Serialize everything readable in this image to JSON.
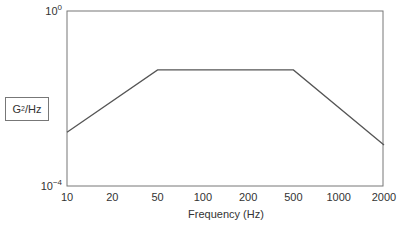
{
  "chart_data": {
    "type": "line",
    "title": "",
    "xlabel": "Frequency (Hz)",
    "ylabel": "G²/Hz",
    "ylabel_base": "G",
    "ylabel_sup": "2",
    "ylabel_rest": "/Hz",
    "x_ticks": [
      "10",
      "20",
      "50",
      "100",
      "200",
      "500",
      "1000",
      "2000"
    ],
    "y_ticks": [
      {
        "base": "10",
        "exp": "0",
        "value": 1
      },
      {
        "base": "10",
        "exp": "−4",
        "value": 0.0001
      }
    ],
    "ylim": [
      0.0001,
      1
    ],
    "y_scale": "log",
    "grid": false,
    "legend": null,
    "series": [
      {
        "name": "PSD profile",
        "x": [
          10,
          50,
          500,
          2000
        ],
        "values": [
          0.0017,
          0.045,
          0.045,
          0.00087
        ]
      }
    ],
    "line_color": "#555555",
    "frame_color": "#777777"
  }
}
